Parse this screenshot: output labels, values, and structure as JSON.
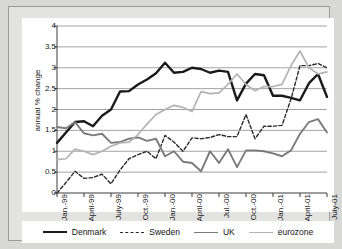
{
  "chart_data": {
    "type": "line",
    "title": "",
    "xlabel": "",
    "ylabel": "annual % change",
    "ylim": [
      0,
      4
    ],
    "yticks": [
      "0",
      "0.5",
      "1",
      "1.5",
      "2",
      "2.5",
      "3",
      "3.5",
      "4"
    ],
    "grid": true,
    "legend_position": "bottom",
    "x": [
      "Jan.-99",
      "Feb-99",
      "Mar-99",
      "April-99",
      "May-99",
      "Jun-99",
      "July-99",
      "Aug-99",
      "Sep-99",
      "Oct.-99",
      "Nov-99",
      "Dec-99",
      "Jan.-00",
      "Feb-00",
      "Mar-00",
      "April-00",
      "May-00",
      "Jun-00",
      "Jul.-00",
      "Aug-00",
      "Sep-00",
      "Oct.-00",
      "Nov-00",
      "Dec-00",
      "Jan.-01",
      "Feb-01",
      "Mar-01",
      "April-01",
      "May-01",
      "Jun-01",
      "July-01"
    ],
    "xticks": [
      "Jan.-99",
      "April-99",
      "July-99",
      "Oct.-99",
      "Jan.-00",
      "April-00",
      "Jul.-00",
      "Oct.-00",
      "Jan.-01",
      "April-01",
      "July-01"
    ],
    "xtick_indices": [
      0,
      3,
      6,
      9,
      12,
      15,
      18,
      21,
      24,
      27,
      30
    ],
    "series": [
      {
        "name": "Denmark",
        "color": "#1a1a1a",
        "style": "solid",
        "width": 2.4,
        "values": [
          1.2,
          1.45,
          1.7,
          1.72,
          1.6,
          1.85,
          2.0,
          2.43,
          2.44,
          2.6,
          2.72,
          2.87,
          3.12,
          2.88,
          2.9,
          3.0,
          2.97,
          2.88,
          2.93,
          2.9,
          2.22,
          2.62,
          2.85,
          2.82,
          2.33,
          2.33,
          2.28,
          2.22,
          2.63,
          2.85,
          2.3
        ]
      },
      {
        "name": "Sweden",
        "color": "#2b2b2b",
        "style": "dashed",
        "width": 1.4,
        "values": [
          0.0,
          0.25,
          0.52,
          0.35,
          0.37,
          0.45,
          0.22,
          0.55,
          0.82,
          0.92,
          1.0,
          0.82,
          1.38,
          1.22,
          1.0,
          1.32,
          1.3,
          1.33,
          1.4,
          1.35,
          1.35,
          1.88,
          1.3,
          1.6,
          1.6,
          1.62,
          2.25,
          3.05,
          3.05,
          3.1,
          3.0
        ]
      },
      {
        "name": "UK",
        "color": "#7b7b7b",
        "style": "solid",
        "width": 1.9,
        "values": [
          1.58,
          1.55,
          1.7,
          1.43,
          1.38,
          1.42,
          1.2,
          1.22,
          1.3,
          1.33,
          1.25,
          1.3,
          0.88,
          1.0,
          0.75,
          0.72,
          0.52,
          1.0,
          0.72,
          1.05,
          0.62,
          1.02,
          1.02,
          1.0,
          0.95,
          0.88,
          1.02,
          1.42,
          1.7,
          1.77,
          1.45
        ]
      },
      {
        "name": "eurozone",
        "color": "#b3b3b3",
        "style": "solid",
        "width": 1.7,
        "values": [
          0.8,
          0.82,
          1.05,
          1.0,
          0.92,
          1.0,
          1.12,
          1.2,
          1.22,
          1.4,
          1.65,
          1.88,
          2.0,
          2.1,
          2.05,
          1.95,
          2.43,
          2.38,
          2.4,
          2.6,
          2.85,
          2.6,
          2.45,
          2.55,
          2.55,
          2.6,
          3.05,
          3.4,
          3.0,
          2.85,
          2.9
        ]
      }
    ]
  },
  "legend": {
    "items": [
      {
        "label": "Denmark"
      },
      {
        "label": "Sweden"
      },
      {
        "label": "UK"
      },
      {
        "label": "eurozone"
      }
    ]
  }
}
